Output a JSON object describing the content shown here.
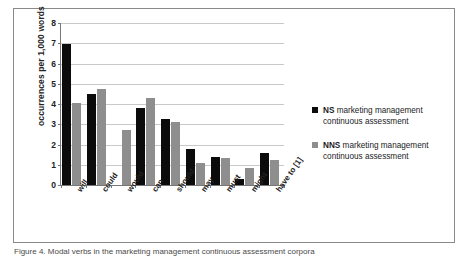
{
  "chart_data": {
    "type": "bar",
    "title": "",
    "xlabel": "",
    "ylabel": "occurrences per 1,000 words",
    "ylim": [
      0,
      8
    ],
    "ytick_labels": [
      "0",
      "1",
      "2",
      "3",
      "4",
      "5",
      "6",
      "7",
      "8"
    ],
    "ytick_values": [
      0,
      1,
      2,
      3,
      4,
      5,
      6,
      7,
      8
    ],
    "grid": true,
    "legend_position": "right",
    "categories": [
      "will",
      "could",
      "would",
      "can",
      "should",
      "may",
      "must",
      "might",
      "have to [1]"
    ],
    "series": [
      {
        "name": "NS marketing management continuous assessment",
        "color": "#0b0b0b",
        "values": [
          6.95,
          4.5,
          0,
          3.8,
          3.25,
          1.8,
          1.4,
          0.3,
          1.6
        ]
      },
      {
        "name": "NNS marketing management continuous assessment",
        "color": "#8e8e8e",
        "values": [
          4.05,
          4.75,
          2.7,
          4.3,
          3.1,
          1.1,
          1.35,
          0.85,
          1.25
        ]
      }
    ]
  },
  "legend": {
    "entries": [
      {
        "lead": "NS",
        "rest": "marketing management continuous assessment",
        "color": "#0b0b0b"
      },
      {
        "lead": "NNS",
        "rest": "marketing management continuous assessment",
        "color": "#8e8e8e"
      }
    ]
  },
  "caption": {
    "text": "Figure 4. Modal verbs in the marketing management continuous assessment corpora"
  },
  "colors": {
    "series_ns": "#0b0b0b",
    "series_nns": "#8e8e8e",
    "gridline": "#c9c9c9",
    "axis": "#777777",
    "frame": "#8a8a8a"
  }
}
